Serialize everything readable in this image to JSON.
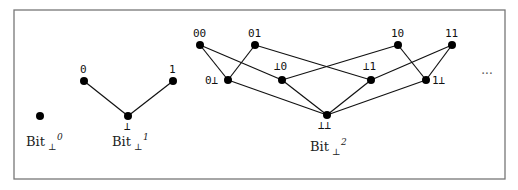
{
  "figure": {
    "frame": {
      "x": 14,
      "y": 10,
      "width": 491,
      "height": 169,
      "stroke": "#777777"
    },
    "node_color": "#000000",
    "edge_color": "#111111",
    "ellipsis": {
      "text": "···",
      "x": 487,
      "y": 78
    }
  },
  "lattices": [
    {
      "name": "bit0",
      "label": {
        "base": "Bit",
        "sub": "⊥",
        "sup": "0",
        "x": 26,
        "y": 146
      },
      "nodes": [
        {
          "id": "unit",
          "x": 40,
          "y": 116,
          "label": "",
          "lx": 0,
          "ly": 0
        }
      ],
      "edges": []
    },
    {
      "name": "bit1",
      "label": {
        "base": "Bit",
        "sub": "⊥",
        "sup": "1",
        "x": 112,
        "y": 146
      },
      "nodes": [
        {
          "id": "0",
          "x": 84,
          "y": 81,
          "label": "0",
          "lx": 80,
          "ly": 73
        },
        {
          "id": "1",
          "x": 173,
          "y": 81,
          "label": "1",
          "lx": 169,
          "ly": 73
        },
        {
          "id": "bot",
          "x": 128,
          "y": 116,
          "label": "⊥",
          "lx": 124,
          "ly": 130
        }
      ],
      "edges": [
        [
          "0",
          "bot"
        ],
        [
          "1",
          "bot"
        ]
      ]
    },
    {
      "name": "bit2",
      "label": {
        "base": "Bit",
        "sub": "⊥",
        "sup": "2",
        "x": 310,
        "y": 151
      },
      "nodes": [
        {
          "id": "00",
          "x": 200,
          "y": 45,
          "label": "00",
          "lx": 193,
          "ly": 37
        },
        {
          "id": "01",
          "x": 255,
          "y": 45,
          "label": "01",
          "lx": 248,
          "ly": 37
        },
        {
          "id": "10",
          "x": 398,
          "y": 45,
          "label": "10",
          "lx": 391,
          "ly": 37
        },
        {
          "id": "11",
          "x": 452,
          "y": 45,
          "label": "11",
          "lx": 445,
          "ly": 37
        },
        {
          "id": "0b",
          "x": 228,
          "y": 80,
          "label": "0⊥",
          "lx": 205,
          "ly": 84
        },
        {
          "id": "b0",
          "x": 282,
          "y": 80,
          "label": "⊥0",
          "lx": 274,
          "ly": 70
        },
        {
          "id": "b1",
          "x": 371,
          "y": 80,
          "label": "⊥1",
          "lx": 363,
          "ly": 70
        },
        {
          "id": "1b",
          "x": 426,
          "y": 80,
          "label": "1⊥",
          "lx": 432,
          "ly": 84
        },
        {
          "id": "bb",
          "x": 327,
          "y": 115,
          "label": "⊥⊥",
          "lx": 318,
          "ly": 129
        }
      ],
      "edges": [
        [
          "00",
          "0b"
        ],
        [
          "01",
          "0b"
        ],
        [
          "00",
          "b0"
        ],
        [
          "10",
          "b0"
        ],
        [
          "01",
          "b1"
        ],
        [
          "11",
          "b1"
        ],
        [
          "10",
          "1b"
        ],
        [
          "11",
          "1b"
        ],
        [
          "0b",
          "bb"
        ],
        [
          "b0",
          "bb"
        ],
        [
          "b1",
          "bb"
        ],
        [
          "1b",
          "bb"
        ]
      ]
    }
  ]
}
